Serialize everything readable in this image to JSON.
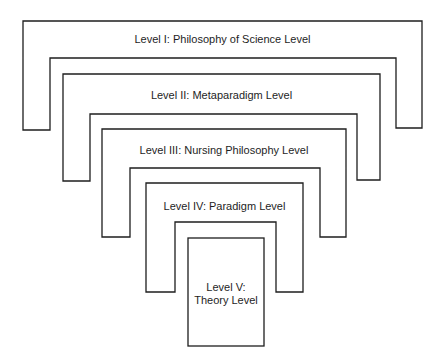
{
  "diagram": {
    "type": "nested-hierarchy",
    "colors": {
      "stroke": "#1e1e1e",
      "fill": "#ffffff",
      "text": "#1e1e1e"
    },
    "levels": [
      {
        "id": "level-1",
        "label": "Level I: Philosophy of Science Level"
      },
      {
        "id": "level-2",
        "label": "Level II: Metaparadigm Level"
      },
      {
        "id": "level-3",
        "label": "Level III: Nursing Philosophy Level"
      },
      {
        "id": "level-4",
        "label": "Level IV: Paradigm Level"
      },
      {
        "id": "level-5",
        "label_line1": "Level V:",
        "label_line2": "Theory Level"
      }
    ]
  }
}
